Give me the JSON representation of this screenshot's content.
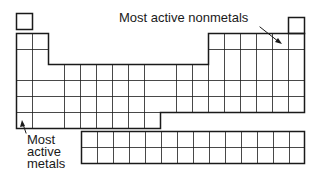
{
  "diagram": {
    "type": "periodic-table-outline",
    "annotations": {
      "nonmetals_label": "Most active nonmetals",
      "metals_label_lines": [
        "Most",
        "active",
        "metals"
      ]
    },
    "grid": {
      "cell_size_px": 16,
      "main_columns": 18,
      "main_rows": 7,
      "inner_block_columns": 14,
      "inner_block_rows": 2
    },
    "colors": {
      "line": "#1a1a1a",
      "background": "#ffffff"
    }
  }
}
